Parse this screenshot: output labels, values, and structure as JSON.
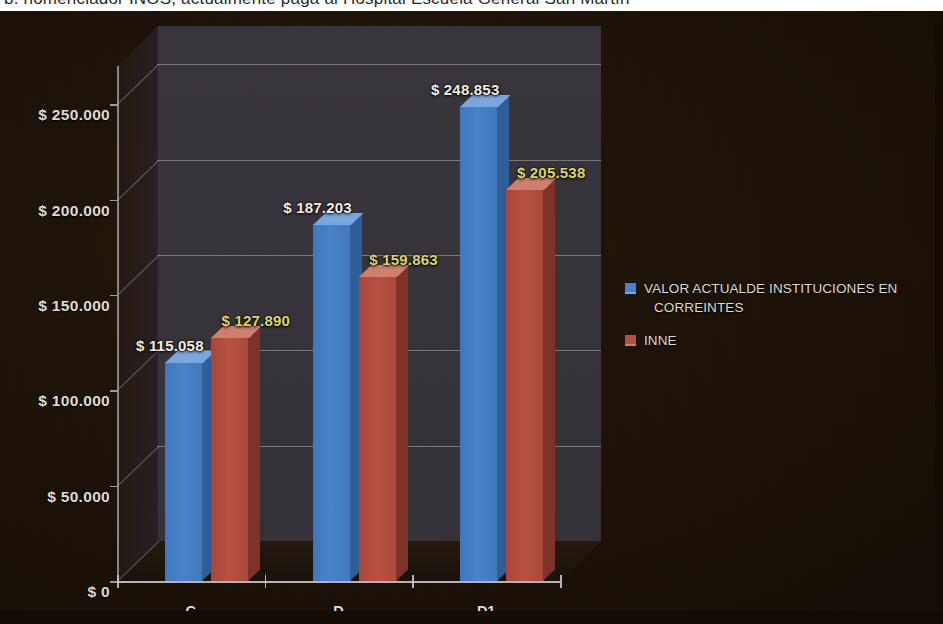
{
  "caption": {
    "text": "b. nomenclador INOS, actualmente paga al Hospital Escuela General San Martín"
  },
  "legend": {
    "position": "right",
    "items": [
      {
        "name": "series-1",
        "label_line1": "VALOR ACTUALDE INSTITUCIONES EN",
        "label_line2": "CORREINTES",
        "color": "#4a82c8"
      },
      {
        "name": "series-2",
        "label_line1": "INNE",
        "label_line2": "",
        "color": "#b55243"
      }
    ]
  },
  "axis": {
    "y_ticks": [
      "$ 0",
      "$ 50.000",
      "$ 100.000",
      "$ 150.000",
      "$ 200.000",
      "$ 250.000"
    ],
    "x_ticks": [
      "C",
      "D",
      "D1"
    ]
  },
  "chart_data": {
    "type": "bar",
    "title": "",
    "subtitle": "",
    "xlabel": "",
    "ylabel": "",
    "categories": [
      "C",
      "D",
      "D1"
    ],
    "ylim": [
      0,
      270000
    ],
    "y_tick_values": [
      0,
      50000,
      100000,
      150000,
      200000,
      250000
    ],
    "y_tick_labels": [
      "$ 0",
      "$ 50.000",
      "$ 100.000",
      "$ 150.000",
      "$ 200.000",
      "$ 250.000"
    ],
    "grid": true,
    "three_d": true,
    "legend_position": "right",
    "series": [
      {
        "name": "VALOR ACTUALDE INSTITUCIONES EN CORREINTES",
        "color": "#4a82c8",
        "label_color": "#f2ece4",
        "values": [
          115058,
          187203,
          248853
        ],
        "data_labels": [
          "$ 115.058",
          "$ 187.203",
          "$ 248.853"
        ]
      },
      {
        "name": "INNE",
        "color": "#b55243",
        "label_color": "#d9d66a",
        "values": [
          127890,
          159863,
          205538
        ],
        "data_labels": [
          "$ 127.890",
          "$ 159.863",
          "$ 205.538"
        ]
      }
    ]
  }
}
